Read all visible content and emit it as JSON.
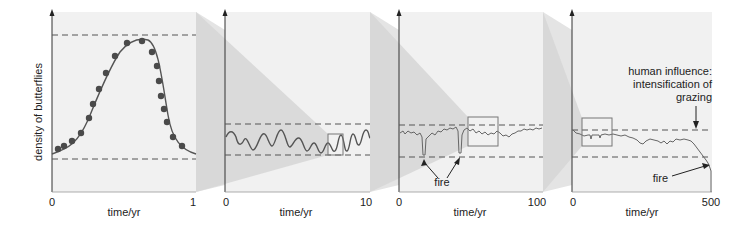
{
  "figure": {
    "y_axis_label": "density of butterflies",
    "x_axis_label": "time/yr",
    "colors": {
      "panel_bg": "#f0f0f0",
      "wedge": "#d9d9d9",
      "side": "#e2e2e2",
      "line": "#555555",
      "dots": "#4a4a4a",
      "dash": "#555555",
      "box": "#777777"
    }
  },
  "panels": [
    {
      "x_start": "0",
      "x_end": "1",
      "x_label": "time/yr",
      "description": "seasonal cycle with data points"
    },
    {
      "x_start": "0",
      "x_end": "10",
      "x_label": "time/yr",
      "description": "annual oscillations"
    },
    {
      "x_start": "0",
      "x_end": "100",
      "x_label": "time/yr",
      "description": "decadal fluctuations with fire dips"
    },
    {
      "x_start": "0",
      "x_end": "500",
      "x_label": "time/yr",
      "description": "long-term decline"
    }
  ],
  "annotations": {
    "fire_p3": "fire",
    "fire_p4": "fire",
    "human_line1": "human influence:",
    "human_line2": "intensification of",
    "human_line3": "grazing"
  }
}
